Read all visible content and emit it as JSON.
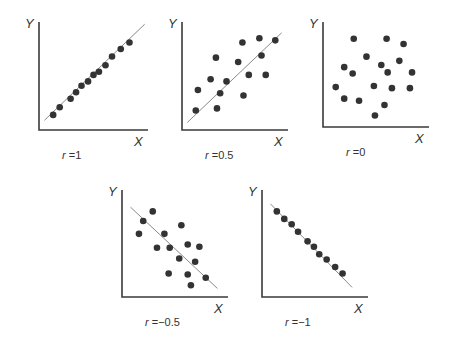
{
  "chart_data": [
    {
      "type": "scatter",
      "title": "",
      "label": "r =1",
      "r": 1,
      "xlabel": "X",
      "ylabel": "Y",
      "xlim": [
        0,
        100
      ],
      "ylim": [
        0,
        100
      ],
      "grid": false,
      "fit_line": {
        "x1": 5,
        "y1": 9,
        "x2": 97,
        "y2": 98
      },
      "points": [
        [
          13,
          14
        ],
        [
          19,
          21
        ],
        [
          29,
          29
        ],
        [
          34,
          35
        ],
        [
          39,
          41
        ],
        [
          45,
          45
        ],
        [
          50,
          51
        ],
        [
          55,
          54
        ],
        [
          61,
          60
        ],
        [
          67,
          68
        ],
        [
          75,
          75
        ],
        [
          83,
          81
        ]
      ],
      "box": {
        "x": 39,
        "y": 22,
        "w": 109,
        "h": 108
      }
    },
    {
      "type": "scatter",
      "title": "",
      "label": "r =0.5",
      "r": 0.5,
      "xlabel": "X",
      "ylabel": "Y",
      "xlim": [
        0,
        100
      ],
      "ylim": [
        0,
        100
      ],
      "grid": false,
      "fit_line": {
        "x1": 5,
        "y1": 7,
        "x2": 94,
        "y2": 90
      },
      "points": [
        [
          13,
          18
        ],
        [
          15,
          37
        ],
        [
          27,
          47
        ],
        [
          32,
          67
        ],
        [
          33,
          20
        ],
        [
          36,
          34
        ],
        [
          42,
          45
        ],
        [
          53,
          63
        ],
        [
          57,
          81
        ],
        [
          58,
          32
        ],
        [
          63,
          51
        ],
        [
          73,
          85
        ],
        [
          75,
          69
        ],
        [
          79,
          51
        ],
        [
          88,
          83
        ]
      ],
      "box": {
        "x": 182,
        "y": 22,
        "w": 106,
        "h": 108
      }
    },
    {
      "type": "scatter",
      "title": "",
      "label": "r =0",
      "r": 0,
      "xlabel": "X",
      "ylabel": "Y",
      "xlim": [
        0,
        100
      ],
      "ylim": [
        0,
        100
      ],
      "grid": false,
      "fit_line": null,
      "points": [
        [
          29,
          84
        ],
        [
          60,
          84
        ],
        [
          76,
          79
        ],
        [
          41,
          67
        ],
        [
          20,
          57
        ],
        [
          55,
          59
        ],
        [
          72,
          63
        ],
        [
          28,
          51
        ],
        [
          61,
          52
        ],
        [
          84,
          52
        ],
        [
          12,
          38
        ],
        [
          48,
          39
        ],
        [
          65,
          37
        ],
        [
          82,
          37
        ],
        [
          20,
          27
        ],
        [
          34,
          25
        ],
        [
          58,
          21
        ],
        [
          49,
          11
        ]
      ],
      "box": {
        "x": 323,
        "y": 22,
        "w": 106,
        "h": 105
      }
    },
    {
      "type": "scatter",
      "title": "",
      "label": "r =−0.5",
      "r": -0.5,
      "xlabel": "X",
      "ylabel": "Y",
      "xlim": [
        0,
        100
      ],
      "ylim": [
        0,
        100
      ],
      "grid": false,
      "fit_line": {
        "x1": 8,
        "y1": 84,
        "x2": 90,
        "y2": 8
      },
      "points": [
        [
          29,
          80
        ],
        [
          20,
          71
        ],
        [
          16,
          59
        ],
        [
          56,
          67
        ],
        [
          40,
          59
        ],
        [
          33,
          46
        ],
        [
          45,
          46
        ],
        [
          62,
          49
        ],
        [
          73,
          47
        ],
        [
          54,
          36
        ],
        [
          69,
          33
        ],
        [
          44,
          22
        ],
        [
          62,
          21
        ],
        [
          79,
          18
        ],
        [
          65,
          11
        ]
      ],
      "box": {
        "x": 122,
        "y": 190,
        "w": 106,
        "h": 107
      }
    },
    {
      "type": "scatter",
      "title": "",
      "label": "r =−1",
      "r": -1,
      "xlabel": "X",
      "ylabel": "Y",
      "xlim": [
        0,
        100
      ],
      "ylim": [
        0,
        100
      ],
      "grid": false,
      "fit_line": {
        "x1": 8,
        "y1": 87,
        "x2": 85,
        "y2": 9
      },
      "points": [
        [
          14,
          80
        ],
        [
          21,
          73
        ],
        [
          28,
          68
        ],
        [
          34,
          61
        ],
        [
          43,
          52
        ],
        [
          49,
          47
        ],
        [
          54,
          40
        ],
        [
          61,
          35
        ],
        [
          69,
          28
        ],
        [
          76,
          22
        ]
      ],
      "box": {
        "x": 262,
        "y": 190,
        "w": 106,
        "h": 107
      }
    }
  ]
}
